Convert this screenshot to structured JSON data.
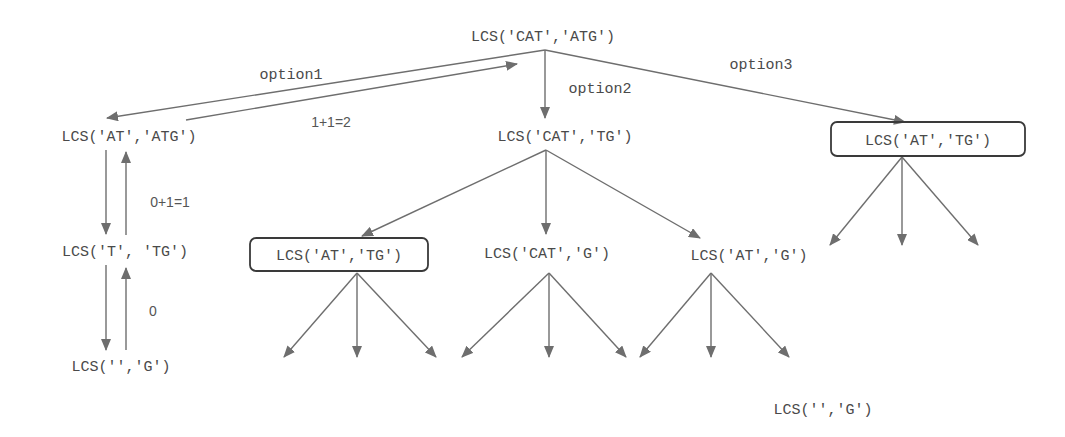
{
  "diagram": {
    "colors": {
      "edge": "#6e6e6e",
      "text": "#4a4a4a",
      "box": "#3a3a3a",
      "background": "#ffffff"
    },
    "nodes": {
      "root": "LCS('CAT','ATG')",
      "opt1": "LCS('AT','ATG')",
      "opt2": "LCS('CAT','TG')",
      "opt3": "LCS('AT','TG')",
      "t_tg": "LCS('T', 'TG')",
      "empty_g_left": "LCS('','G')",
      "at_tg_boxed": "LCS('AT','TG')",
      "cat_g": "LCS('CAT','G')",
      "at_g": "LCS('AT','G')",
      "empty_g_bottom": "LCS('','G')"
    },
    "edge_labels": {
      "option1": "option1",
      "option2": "option2",
      "option3": "option3",
      "return_opt1": "1+1=2",
      "return_t_tg": "0+1=1",
      "return_empty": "0"
    },
    "highlighted_nodes": [
      "opt3",
      "at_tg_boxed"
    ]
  }
}
